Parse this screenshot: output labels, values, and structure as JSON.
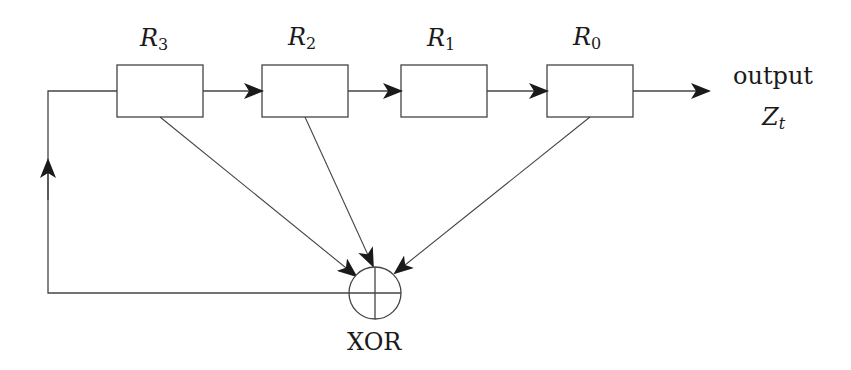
{
  "diagram": {
    "type": "LFSR block diagram",
    "registers": [
      {
        "id": "R3",
        "name": "R",
        "sub": "3",
        "box": {
          "x": 117,
          "y": 65,
          "w": 86,
          "h": 52
        }
      },
      {
        "id": "R2",
        "name": "R",
        "sub": "2",
        "box": {
          "x": 262,
          "y": 65,
          "w": 86,
          "h": 52
        }
      },
      {
        "id": "R1",
        "name": "R",
        "sub": "1",
        "box": {
          "x": 401,
          "y": 65,
          "w": 86,
          "h": 52
        }
      },
      {
        "id": "R0",
        "name": "R",
        "sub": "0",
        "box": {
          "x": 547,
          "y": 65,
          "w": 86,
          "h": 52
        }
      }
    ],
    "output": {
      "label": "output",
      "symbol": "Z",
      "sub": "t"
    },
    "xor": {
      "label": "XOR",
      "cx": 375,
      "cy": 293,
      "r": 26
    },
    "edges": [
      {
        "from": "R3",
        "to": "R2"
      },
      {
        "from": "R2",
        "to": "R1"
      },
      {
        "from": "R1",
        "to": "R0"
      },
      {
        "from": "R0",
        "to": "output"
      },
      {
        "from": "R3",
        "to": "XOR"
      },
      {
        "from": "R2",
        "to": "XOR"
      },
      {
        "from": "R0",
        "to": "XOR"
      },
      {
        "from": "XOR",
        "to": "R3",
        "via": "feedback"
      }
    ],
    "colors": {
      "line": "#333333",
      "arrow": "#1a1a1a",
      "background": "#ffffff"
    }
  }
}
